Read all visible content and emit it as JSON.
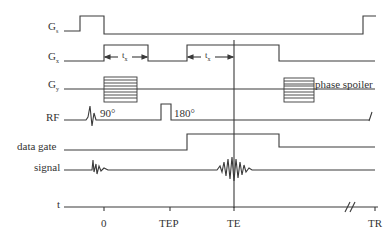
{
  "diagram": {
    "type": "pulse-sequence timing diagram",
    "rows": [
      {
        "id": "gs",
        "label": "G",
        "subscript": "s"
      },
      {
        "id": "gx",
        "label": "G",
        "subscript": "x"
      },
      {
        "id": "gy",
        "label": "G",
        "subscript": "y"
      },
      {
        "id": "rf",
        "label": "RF"
      },
      {
        "id": "data_gate",
        "label": "data gate"
      },
      {
        "id": "signal",
        "label": "signal"
      },
      {
        "id": "t",
        "label": "t"
      }
    ],
    "annotations": {
      "rf_90": "90°",
      "rf_180": "180°",
      "phase_spoiler": "phase spoiler",
      "tx_1": "t",
      "tx_1_sub": "x",
      "tx_2": "t",
      "tx_2_sub": "x"
    },
    "time_axis": {
      "ticks": [
        "0",
        "TEP",
        "TE",
        "TR"
      ],
      "break_mark": "//"
    },
    "stroke_color": "#3a3a3a"
  }
}
